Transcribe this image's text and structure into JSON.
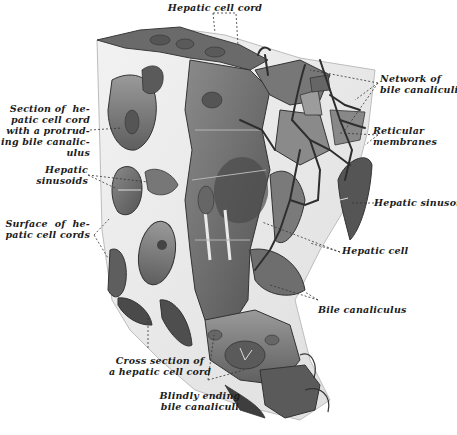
{
  "figure": {
    "labels": [
      {
        "id": "hepatic-cell-cord",
        "text": "Hepatic cell cord"
      },
      {
        "id": "network-bile-canaliculi",
        "text": "Network of\nbile canaliculi"
      },
      {
        "id": "section-hepatic-cell-cord",
        "text": "Section of  he-\npatic cell cord\nwith a protrud-\ning bile canalic-\nulus"
      },
      {
        "id": "reticular-membranes",
        "text": "Reticular\nmembranes"
      },
      {
        "id": "hepatic-sinusoids",
        "text": "Hepatic\nsinusoids"
      },
      {
        "id": "hepatic-sinusoid",
        "text": "Hepatic sinusoid"
      },
      {
        "id": "surface-hepatic-cell-cords",
        "text": "Surface  of  he-\npatic cell cords"
      },
      {
        "id": "hepatic-cell",
        "text": "Hepatic cell"
      },
      {
        "id": "bile-canaliculus",
        "text": "Bile canaliculus"
      },
      {
        "id": "cross-section-hepatic-cell-cord",
        "text": "Cross section of\na hepatic cell cord"
      },
      {
        "id": "blindly-ending-bile-canaliculi",
        "text": "Blindly ending\nbile canaliculi"
      }
    ]
  },
  "colors": {
    "background": "#ffffff",
    "tissue_dark": "#4a4a4a",
    "tissue_mid": "#7a7a7a",
    "tissue_light": "#a8a8a8",
    "block_face": "#ececec",
    "canaliculi": "#2e2e2e",
    "leader": "#333333"
  }
}
